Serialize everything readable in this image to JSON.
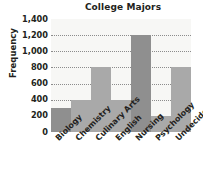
{
  "chart_data": {
    "type": "bar",
    "title": "College Majors",
    "xlabel": "",
    "ylabel": "Frequency",
    "categories": [
      "Biology",
      "Chemistry",
      "Culinary Arts",
      "English",
      "Nursing",
      "Psychology",
      "Undecided"
    ],
    "values": [
      300,
      400,
      800,
      400,
      1200,
      200,
      800
    ],
    "ylim": [
      0,
      1400
    ],
    "ytick_labels": [
      "1,400",
      "1,200",
      "1,000",
      "800",
      "600",
      "400",
      "200",
      "0"
    ],
    "ytick_values": [
      1400,
      1200,
      1000,
      800,
      600,
      400,
      200,
      0
    ],
    "grid": true,
    "grid_style": "dotted-horizontal",
    "legend": null,
    "bar_gap": 0,
    "colors": {
      "bar_light": "#a9a9a9",
      "bar_dark": "#8f8f8f",
      "plot_background": "#f7f7f5",
      "grid": "#8c8c8c",
      "text": "#231f20",
      "figure_background": "#ffffff"
    },
    "bar_shades": [
      "dark",
      "light",
      "light",
      "light",
      "dark",
      "light",
      "light"
    ]
  }
}
